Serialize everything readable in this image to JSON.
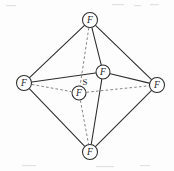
{
  "figure": {
    "background_color": "#fdfdfd",
    "bond_color": "#2b2b2b",
    "hidden_bond_color": "#6e6e6e",
    "label_color": "#1d1d1d",
    "width": 174,
    "height": 171
  },
  "atoms": [
    {
      "id": "f-top",
      "label": "F",
      "circled": true,
      "cx": 90,
      "cy": 20,
      "r": 7.5,
      "position": "axial-top"
    },
    {
      "id": "f-left",
      "label": "F",
      "circled": true,
      "cx": 24,
      "cy": 83,
      "r": 7.5,
      "position": "equatorial-left"
    },
    {
      "id": "f-right",
      "label": "F",
      "circled": true,
      "cx": 157,
      "cy": 85,
      "r": 7.5,
      "position": "equatorial-right"
    },
    {
      "id": "f-bottom",
      "label": "F",
      "circled": true,
      "cx": 90,
      "cy": 152,
      "r": 7.5,
      "position": "axial-bottom"
    },
    {
      "id": "f-back",
      "label": "F",
      "circled": true,
      "cx": 103,
      "cy": 72,
      "r": 7.0,
      "position": "equatorial-back"
    },
    {
      "id": "f-front",
      "label": "F",
      "circled": true,
      "cx": 79,
      "cy": 93,
      "r": 7.0,
      "position": "equatorial-front"
    },
    {
      "id": "s-center",
      "label": "S",
      "circled": false,
      "cx": 85,
      "cy": 82,
      "r": 0,
      "position": "center"
    }
  ],
  "bonds": [
    {
      "id": "bond-top-left",
      "from": "f-top",
      "to": "f-left",
      "style": "solid"
    },
    {
      "id": "bond-top-right",
      "from": "f-top",
      "to": "f-right",
      "style": "solid"
    },
    {
      "id": "bond-left-bottom",
      "from": "f-left",
      "to": "f-bottom",
      "style": "solid"
    },
    {
      "id": "bond-right-bottom",
      "from": "f-right",
      "to": "f-bottom",
      "style": "solid"
    },
    {
      "id": "bond-top-back",
      "from": "f-top",
      "to": "f-back",
      "style": "solid"
    },
    {
      "id": "bond-back-bottom",
      "from": "f-back",
      "to": "f-bottom",
      "style": "solid"
    },
    {
      "id": "bond-left-back",
      "from": "f-left",
      "to": "f-back",
      "style": "solid"
    },
    {
      "id": "bond-back-right",
      "from": "f-back",
      "to": "f-right",
      "style": "solid"
    },
    {
      "id": "bond-top-front",
      "from": "f-top",
      "to": "f-front",
      "style": "dashed"
    },
    {
      "id": "bond-front-bottom",
      "from": "f-front",
      "to": "f-bottom",
      "style": "dashed"
    },
    {
      "id": "bond-left-front",
      "from": "f-left",
      "to": "f-front",
      "style": "dashed"
    },
    {
      "id": "bond-front-right",
      "from": "f-front",
      "to": "f-right",
      "style": "dashed"
    }
  ],
  "chart_data": {
    "type": "diagram",
    "central_atom": "S",
    "ligand_atom": "F",
    "ligand_count": 6,
    "geometry": "octahedral",
    "vertex_labels": [
      "F",
      "F",
      "F",
      "F",
      "F",
      "F"
    ],
    "center_label": "S",
    "solid_edge_count": 8,
    "dashed_edge_count": 4
  }
}
